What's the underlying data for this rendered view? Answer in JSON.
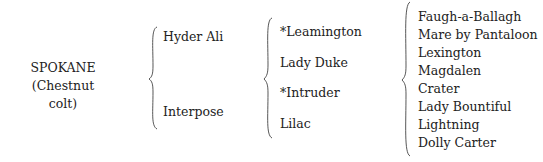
{
  "pedigree": {
    "subject": {
      "name": "SPOKANE",
      "description": "(Chestnut colt)"
    },
    "generation1": [
      "Hyder Ali",
      "Interpose"
    ],
    "generation2": [
      "*Leamington",
      "Lady Duke",
      "*Intruder",
      "Lilac"
    ],
    "generation3": [
      "Faugh-a-Ballagh",
      "Mare by Pantaloon",
      "Lexington",
      "Magdalen",
      "Crater",
      "Lady Bountiful",
      "Lightning",
      "Dolly Carter"
    ]
  }
}
